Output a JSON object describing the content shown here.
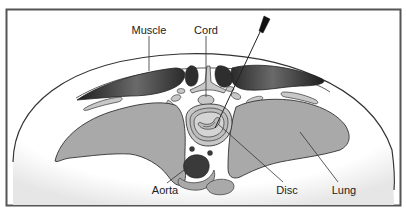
{
  "diagram": {
    "type": "anatomical cross-section",
    "labels": {
      "muscle": "Muscle",
      "cord": "Cord",
      "aorta": "Aorta",
      "disc": "Disc",
      "lung": "Lung"
    },
    "colors": {
      "frame": "#555555",
      "outline": "#333333",
      "lung_fill": "#a9a9a9",
      "muscle_fill": "#3a3a3a",
      "dark_fill": "#2e2e2e",
      "light_fill": "#c8c8c8",
      "background": "#ffffff"
    }
  }
}
